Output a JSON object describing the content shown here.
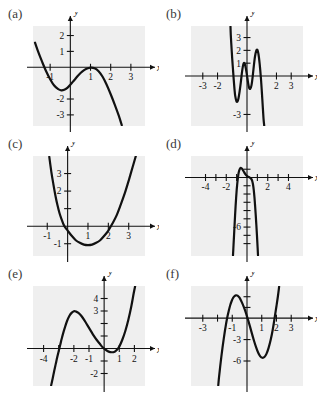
{
  "page": {
    "background": "#ffffff",
    "plot_background": "#efefef",
    "ink": "#111111"
  },
  "panels": [
    {
      "id": "a",
      "label": "(a)",
      "x_axis_label": "x",
      "y_axis_label": "y",
      "box": {
        "left": 33,
        "top": 26,
        "width": 112,
        "height": 100
      },
      "xrange": [
        -1.85,
        3.7
      ],
      "yrange": [
        -3.7,
        2.6
      ],
      "origin_px": {
        "x": 0,
        "y": 0
      },
      "xticks": [
        {
          "v": -1,
          "label": "-1"
        },
        {
          "v": 1,
          "label": "1"
        },
        {
          "v": 2,
          "label": "2"
        },
        {
          "v": 3,
          "label": "3"
        }
      ],
      "yticks": [
        {
          "v": 2,
          "label": "2"
        },
        {
          "v": 1,
          "label": "1"
        },
        {
          "v": -2,
          "label": "-2"
        },
        {
          "v": -3,
          "label": "-3"
        }
      ],
      "curve": [
        [
          -1.75,
          1.55
        ],
        [
          -1.6,
          1.0
        ],
        [
          -1.4,
          0.35
        ],
        [
          -1.2,
          -0.25
        ],
        [
          -1.0,
          -0.75
        ],
        [
          -0.8,
          -1.15
        ],
        [
          -0.6,
          -1.38
        ],
        [
          -0.45,
          -1.45
        ],
        [
          -0.3,
          -1.42
        ],
        [
          -0.15,
          -1.3
        ],
        [
          0.0,
          -1.1
        ],
        [
          0.2,
          -0.8
        ],
        [
          0.4,
          -0.5
        ],
        [
          0.6,
          -0.26
        ],
        [
          0.8,
          -0.1
        ],
        [
          1.0,
          -0.02
        ],
        [
          1.2,
          -0.06
        ],
        [
          1.4,
          -0.25
        ],
        [
          1.6,
          -0.6
        ],
        [
          1.8,
          -1.1
        ],
        [
          2.0,
          -1.7
        ],
        [
          2.2,
          -2.35
        ],
        [
          2.4,
          -3.05
        ],
        [
          2.55,
          -3.65
        ]
      ]
    },
    {
      "id": "b",
      "label": "(b)",
      "x_axis_label": "x",
      "y_axis_label": "y",
      "box": {
        "left": 191,
        "top": 26,
        "width": 112,
        "height": 100
      },
      "xrange": [
        -3.8,
        3.8
      ],
      "yrange": [
        -3.9,
        3.9
      ],
      "xticks": [
        {
          "v": -3,
          "label": "-3"
        },
        {
          "v": -2,
          "label": "-2"
        },
        {
          "v": 2,
          "label": "2"
        },
        {
          "v": 3,
          "label": "3"
        }
      ],
      "yticks": [
        {
          "v": 3,
          "label": "3"
        },
        {
          "v": 2,
          "label": "2"
        },
        {
          "v": 1,
          "label": "1"
        },
        {
          "v": -3,
          "label": "-3"
        }
      ],
      "curve": [
        [
          -1.12,
          3.85
        ],
        [
          -1.1,
          3.2
        ],
        [
          -1.05,
          2.2
        ],
        [
          -1.0,
          1.3
        ],
        [
          -0.95,
          0.5
        ],
        [
          -0.9,
          -0.3
        ],
        [
          -0.85,
          -1.0
        ],
        [
          -0.8,
          -1.55
        ],
        [
          -0.72,
          -1.95
        ],
        [
          -0.65,
          -2.0
        ],
        [
          -0.58,
          -1.75
        ],
        [
          -0.5,
          -1.2
        ],
        [
          -0.42,
          -0.5
        ],
        [
          -0.35,
          0.2
        ],
        [
          -0.28,
          0.75
        ],
        [
          -0.22,
          1.0
        ],
        [
          -0.15,
          0.95
        ],
        [
          -0.08,
          0.6
        ],
        [
          0.0,
          0.05
        ],
        [
          0.07,
          -0.5
        ],
        [
          0.14,
          -0.9
        ],
        [
          0.22,
          -1.0
        ],
        [
          0.3,
          -0.75
        ],
        [
          0.38,
          -0.1
        ],
        [
          0.46,
          0.75
        ],
        [
          0.54,
          1.5
        ],
        [
          0.62,
          1.95
        ],
        [
          0.7,
          2.05
        ],
        [
          0.78,
          1.7
        ],
        [
          0.86,
          0.95
        ],
        [
          0.94,
          -0.1
        ],
        [
          1.0,
          -1.1
        ],
        [
          1.06,
          -2.2
        ],
        [
          1.12,
          -3.3
        ],
        [
          1.17,
          -3.9
        ]
      ]
    },
    {
      "id": "c",
      "label": "(c)",
      "x_axis_label": "x",
      "y_axis_label": "y",
      "box": {
        "left": 33,
        "top": 156,
        "width": 112,
        "height": 100
      },
      "xrange": [
        -1.7,
        3.8
      ],
      "yrange": [
        -1.7,
        4.0
      ],
      "xticks": [
        {
          "v": -1,
          "label": "-1"
        },
        {
          "v": 1,
          "label": "1"
        },
        {
          "v": 2,
          "label": "2"
        },
        {
          "v": 3,
          "label": "3"
        }
      ],
      "yticks": [
        {
          "v": 3,
          "label": "3"
        },
        {
          "v": 2,
          "label": "2"
        },
        {
          "v": 1,
          "label": ""
        },
        {
          "v": -1,
          "label": "-1"
        }
      ],
      "curve": [
        [
          -0.9,
          3.95
        ],
        [
          -0.8,
          3.1
        ],
        [
          -0.7,
          2.4
        ],
        [
          -0.6,
          1.75
        ],
        [
          -0.5,
          1.2
        ],
        [
          -0.4,
          0.75
        ],
        [
          -0.3,
          0.4
        ],
        [
          -0.2,
          0.1
        ],
        [
          -0.1,
          -0.1
        ],
        [
          0.0,
          -0.25
        ],
        [
          0.2,
          -0.55
        ],
        [
          0.4,
          -0.8
        ],
        [
          0.6,
          -0.95
        ],
        [
          0.8,
          -1.05
        ],
        [
          1.0,
          -1.08
        ],
        [
          1.2,
          -1.05
        ],
        [
          1.4,
          -0.95
        ],
        [
          1.6,
          -0.8
        ],
        [
          1.8,
          -0.55
        ],
        [
          2.0,
          -0.25
        ],
        [
          2.2,
          0.15
        ],
        [
          2.4,
          0.6
        ],
        [
          2.6,
          1.2
        ],
        [
          2.8,
          1.85
        ],
        [
          3.0,
          2.6
        ],
        [
          3.2,
          3.4
        ],
        [
          3.35,
          4.0
        ]
      ]
    },
    {
      "id": "d",
      "label": "(d)",
      "x_axis_label": "x",
      "y_axis_label": "y",
      "box": {
        "left": 191,
        "top": 156,
        "width": 112,
        "height": 100
      },
      "xrange": [
        -5.4,
        5.4
      ],
      "yrange": [
        -9.5,
        2.6
      ],
      "xticks": [
        {
          "v": -4,
          "label": "-4"
        },
        {
          "v": -3,
          "label": ""
        },
        {
          "v": -2,
          "label": "-2"
        },
        {
          "v": -1,
          "label": ""
        },
        {
          "v": 1,
          "label": ""
        },
        {
          "v": 2,
          "label": "2"
        },
        {
          "v": 3,
          "label": ""
        },
        {
          "v": 4,
          "label": "4"
        }
      ],
      "yticks": [
        {
          "v": 1,
          "label": ""
        },
        {
          "v": -1,
          "label": ""
        },
        {
          "v": -2,
          "label": ""
        },
        {
          "v": -3,
          "label": ""
        },
        {
          "v": -4,
          "label": ""
        },
        {
          "v": -5,
          "label": ""
        },
        {
          "v": -6,
          "label": "-6"
        },
        {
          "v": -7,
          "label": ""
        },
        {
          "v": -8,
          "label": ""
        }
      ],
      "curve": [
        [
          -1.35,
          -9.4
        ],
        [
          -1.3,
          -8.2
        ],
        [
          -1.25,
          -7.0
        ],
        [
          -1.2,
          -5.8
        ],
        [
          -1.15,
          -4.6
        ],
        [
          -1.1,
          -3.5
        ],
        [
          -1.05,
          -2.5
        ],
        [
          -1.0,
          -1.6
        ],
        [
          -0.95,
          -0.9
        ],
        [
          -0.9,
          -0.3
        ],
        [
          -0.85,
          0.2
        ],
        [
          -0.8,
          0.6
        ],
        [
          -0.72,
          0.95
        ],
        [
          -0.62,
          1.15
        ],
        [
          -0.52,
          1.1
        ],
        [
          -0.42,
          0.95
        ],
        [
          -0.3,
          0.7
        ],
        [
          -0.18,
          0.45
        ],
        [
          -0.05,
          0.25
        ],
        [
          0.1,
          0.1
        ],
        [
          0.25,
          0.0
        ],
        [
          0.4,
          -0.15
        ],
        [
          0.5,
          -0.4
        ],
        [
          0.58,
          -0.85
        ],
        [
          0.65,
          -1.5
        ],
        [
          0.72,
          -2.4
        ],
        [
          0.78,
          -3.4
        ],
        [
          0.84,
          -4.5
        ],
        [
          0.9,
          -5.7
        ],
        [
          0.96,
          -7.0
        ],
        [
          1.02,
          -8.4
        ],
        [
          1.06,
          -9.4
        ]
      ]
    },
    {
      "id": "e",
      "label": "(e)",
      "x_axis_label": "x",
      "y_axis_label": "y",
      "box": {
        "left": 33,
        "top": 286,
        "width": 112,
        "height": 100
      },
      "xrange": [
        -4.7,
        2.7
      ],
      "yrange": [
        -3.0,
        5.0
      ],
      "xticks": [
        {
          "v": -4,
          "label": "-4"
        },
        {
          "v": -3,
          "label": ""
        },
        {
          "v": -2,
          "label": "-2"
        },
        {
          "v": -1,
          "label": "-1"
        },
        {
          "v": 1,
          "label": "1"
        },
        {
          "v": 2,
          "label": "2"
        }
      ],
      "yticks": [
        {
          "v": 4,
          "label": "4"
        },
        {
          "v": 3,
          "label": "3"
        },
        {
          "v": 2,
          "label": ""
        },
        {
          "v": 1,
          "label": ""
        },
        {
          "v": -1,
          "label": ""
        },
        {
          "v": -2,
          "label": "-2"
        }
      ],
      "curve": [
        [
          -3.5,
          -2.95
        ],
        [
          -3.4,
          -2.4
        ],
        [
          -3.3,
          -1.8
        ],
        [
          -3.2,
          -1.25
        ],
        [
          -3.1,
          -0.7
        ],
        [
          -3.0,
          -0.2
        ],
        [
          -2.9,
          0.3
        ],
        [
          -2.8,
          0.8
        ],
        [
          -2.7,
          1.25
        ],
        [
          -2.6,
          1.65
        ],
        [
          -2.45,
          2.2
        ],
        [
          -2.3,
          2.6
        ],
        [
          -2.15,
          2.85
        ],
        [
          -2.0,
          2.98
        ],
        [
          -1.85,
          2.95
        ],
        [
          -1.7,
          2.85
        ],
        [
          -1.5,
          2.6
        ],
        [
          -1.3,
          2.25
        ],
        [
          -1.1,
          1.85
        ],
        [
          -0.9,
          1.45
        ],
        [
          -0.7,
          1.05
        ],
        [
          -0.5,
          0.7
        ],
        [
          -0.3,
          0.4
        ],
        [
          -0.1,
          0.1
        ],
        [
          0.1,
          -0.1
        ],
        [
          0.3,
          -0.25
        ],
        [
          0.5,
          -0.3
        ],
        [
          0.7,
          -0.25
        ],
        [
          0.85,
          -0.1
        ],
        [
          1.0,
          0.15
        ],
        [
          1.2,
          0.7
        ],
        [
          1.4,
          1.4
        ],
        [
          1.6,
          2.3
        ],
        [
          1.8,
          3.4
        ],
        [
          1.95,
          4.4
        ],
        [
          2.05,
          5.0
        ]
      ]
    },
    {
      "id": "f",
      "label": "(f)",
      "x_axis_label": "x",
      "y_axis_label": "y",
      "box": {
        "left": 191,
        "top": 286,
        "width": 112,
        "height": 100
      },
      "xrange": [
        -3.8,
        3.8
      ],
      "yrange": [
        -9.5,
        4.5
      ],
      "xticks": [
        {
          "v": -3,
          "label": "-3"
        },
        {
          "v": -2,
          "label": ""
        },
        {
          "v": -1,
          "label": "-1"
        },
        {
          "v": 1,
          "label": "1"
        },
        {
          "v": 2,
          "label": "2"
        },
        {
          "v": 3,
          "label": "3"
        }
      ],
      "yticks": [
        {
          "v": 3,
          "label": ""
        },
        {
          "v": 1.5,
          "label": ""
        },
        {
          "v": -3,
          "label": "-3"
        },
        {
          "v": -6,
          "label": "-6"
        }
      ],
      "curve": [
        [
          -1.95,
          -9.4
        ],
        [
          -1.9,
          -8.3
        ],
        [
          -1.82,
          -6.8
        ],
        [
          -1.74,
          -5.4
        ],
        [
          -1.66,
          -4.1
        ],
        [
          -1.58,
          -2.9
        ],
        [
          -1.5,
          -1.8
        ],
        [
          -1.42,
          -0.8
        ],
        [
          -1.34,
          0.1
        ],
        [
          -1.24,
          1.0
        ],
        [
          -1.14,
          1.8
        ],
        [
          -1.04,
          2.4
        ],
        [
          -0.94,
          2.85
        ],
        [
          -0.84,
          3.1
        ],
        [
          -0.74,
          3.2
        ],
        [
          -0.64,
          3.15
        ],
        [
          -0.52,
          2.9
        ],
        [
          -0.4,
          2.45
        ],
        [
          -0.28,
          1.9
        ],
        [
          -0.16,
          1.25
        ],
        [
          -0.04,
          0.5
        ],
        [
          0.08,
          -0.3
        ],
        [
          0.2,
          -1.15
        ],
        [
          0.34,
          -2.2
        ],
        [
          0.48,
          -3.2
        ],
        [
          0.62,
          -4.1
        ],
        [
          0.76,
          -4.85
        ],
        [
          0.9,
          -5.35
        ],
        [
          1.04,
          -5.55
        ],
        [
          1.18,
          -5.45
        ],
        [
          1.32,
          -5.0
        ],
        [
          1.46,
          -4.2
        ],
        [
          1.6,
          -3.1
        ],
        [
          1.74,
          -1.7
        ],
        [
          1.88,
          0.1
        ],
        [
          2.0,
          1.7
        ],
        [
          2.1,
          3.1
        ],
        [
          2.18,
          4.4
        ]
      ]
    }
  ]
}
